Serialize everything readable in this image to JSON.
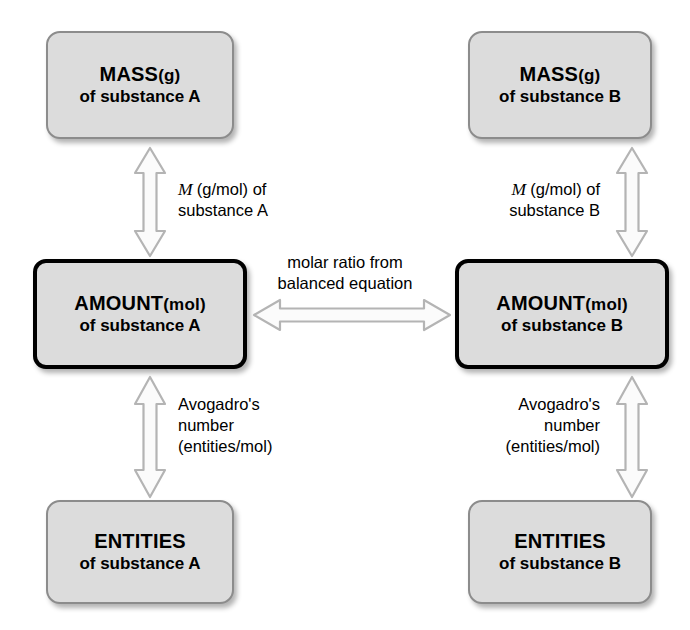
{
  "diagram": {
    "background_color": "#ffffff",
    "box_fill_color": "#dcdcdc",
    "box_border_color": "#8c8c8c",
    "emphasis_border_color": "#000000",
    "arrow_fill_color": "#fbfbfb",
    "arrow_outline_color": "#b4b4b4"
  },
  "nodes": {
    "mass_a": {
      "heading": "MASS",
      "unit": "(g)",
      "subtitle": "of substance A"
    },
    "amount_a": {
      "heading": "AMOUNT",
      "unit": "(mol)",
      "subtitle": "of substance A"
    },
    "entities_a": {
      "heading": "ENTITIES",
      "unit": "",
      "subtitle": "of substance A"
    },
    "mass_b": {
      "heading": "MASS",
      "unit": "(g)",
      "subtitle": "of substance B"
    },
    "amount_b": {
      "heading": "AMOUNT",
      "unit": "(mol)",
      "subtitle": "of substance B"
    },
    "entities_b": {
      "heading": "ENTITIES",
      "unit": "",
      "subtitle": "of substance B"
    }
  },
  "labels": {
    "molar_mass_a": {
      "symbol": "M",
      "line1_rest": " (g/mol) of",
      "line2": "substance A"
    },
    "molar_mass_b": {
      "symbol": "M",
      "line1_rest": " (g/mol) of",
      "line2": "substance B"
    },
    "avogadro_a": {
      "line1": "Avogadro's",
      "line2": "number",
      "line3": "(entities/mol)"
    },
    "avogadro_b": {
      "line1": "Avogadro's",
      "line2": "number",
      "line3": "(entities/mol)"
    },
    "molar_ratio": {
      "line1": "molar ratio from",
      "line2": "balanced equation"
    }
  }
}
